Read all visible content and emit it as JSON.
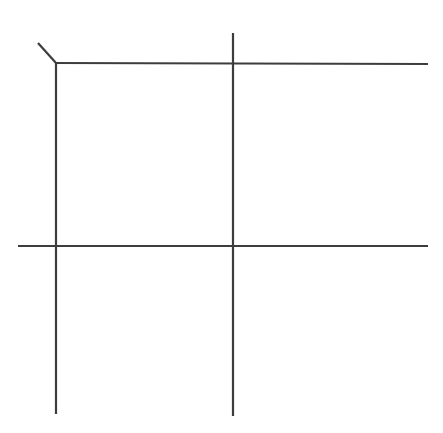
{
  "document": {
    "title": "Line Drawing",
    "type": "line-drawing",
    "width": 443,
    "height": 433,
    "background_color": "#ffffff"
  },
  "figure": {
    "name": "grid-crosshatch-figure",
    "stroke_color": "#3d3d3d",
    "stroke_width": 2.2,
    "strokes": [
      {
        "id": "top-horizontal-line",
        "name": "top-horizontal-line",
        "orientation": "horizontal",
        "x1": 55,
        "y1": 63,
        "x2": 428,
        "y2": 64
      },
      {
        "id": "middle-horizontal-line",
        "name": "middle-horizontal-line",
        "orientation": "horizontal",
        "x1": 18,
        "y1": 246,
        "x2": 428,
        "y2": 246
      },
      {
        "id": "left-vertical-line",
        "name": "left-vertical-line",
        "orientation": "vertical",
        "x1": 56,
        "y1": 62,
        "x2": 56,
        "y2": 414
      },
      {
        "id": "right-vertical-line",
        "name": "right-vertical-line",
        "orientation": "vertical",
        "x1": 233,
        "y1": 33,
        "x2": 233,
        "y2": 416
      },
      {
        "id": "corner-diagonal-tail",
        "name": "corner-diagonal-tail",
        "orientation": "diagonal",
        "x1": 38,
        "y1": 43,
        "x2": 56,
        "y2": 63
      }
    ],
    "intersections": [
      {
        "name": "top-left-corner",
        "x": 56,
        "y": 63
      },
      {
        "name": "top-right-crossing",
        "x": 233,
        "y": 63
      },
      {
        "name": "middle-left-crossing",
        "x": 56,
        "y": 246
      },
      {
        "name": "middle-right-crossing",
        "x": 233,
        "y": 246
      }
    ]
  }
}
